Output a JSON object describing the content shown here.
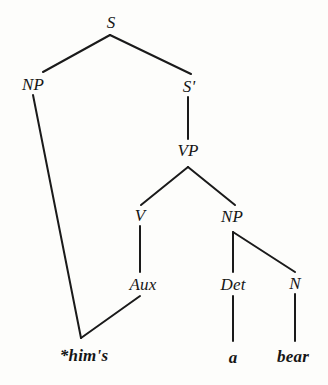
{
  "figure": {
    "kind": "syntax-tree",
    "background_color": "#fdfdfb",
    "stroke_color": "#1a1a1a"
  },
  "nodes": [
    {
      "id": "S",
      "label": "S",
      "x": 111,
      "y": 22,
      "type": "nonterminal"
    },
    {
      "id": "NP1",
      "label": "NP",
      "x": 33,
      "y": 84,
      "type": "nonterminal"
    },
    {
      "id": "SBAR",
      "label": "S'",
      "x": 189,
      "y": 86,
      "type": "nonterminal"
    },
    {
      "id": "VP",
      "label": "VP",
      "x": 188,
      "y": 150,
      "type": "nonterminal"
    },
    {
      "id": "V",
      "label": "V",
      "x": 140,
      "y": 215,
      "type": "nonterminal"
    },
    {
      "id": "NP2",
      "label": "NP",
      "x": 232,
      "y": 216,
      "type": "nonterminal"
    },
    {
      "id": "AUX",
      "label": "Aux",
      "x": 143,
      "y": 284,
      "type": "nonterminal"
    },
    {
      "id": "DET",
      "label": "Det",
      "x": 233,
      "y": 284,
      "type": "nonterminal"
    },
    {
      "id": "N",
      "label": "N",
      "x": 295,
      "y": 283,
      "type": "nonterminal"
    },
    {
      "id": "W1",
      "label": "*him's",
      "x": 84,
      "y": 355,
      "type": "terminal"
    },
    {
      "id": "W2",
      "label": "a",
      "x": 233,
      "y": 357,
      "type": "terminal"
    },
    {
      "id": "W3",
      "label": "bear",
      "x": 293,
      "y": 356,
      "type": "terminal"
    }
  ],
  "edges": [
    {
      "from": "S",
      "to": "NP1",
      "x1": 110,
      "y1": 35,
      "x2": 43,
      "y2": 72
    },
    {
      "from": "S",
      "to": "SBAR",
      "x1": 110,
      "y1": 35,
      "x2": 191,
      "y2": 74
    },
    {
      "from": "SBAR",
      "to": "VP",
      "x1": 188,
      "y1": 97,
      "x2": 188,
      "y2": 139
    },
    {
      "from": "VP",
      "to": "V",
      "x1": 188,
      "y1": 167,
      "x2": 141,
      "y2": 205
    },
    {
      "from": "VP",
      "to": "NP2",
      "x1": 188,
      "y1": 167,
      "x2": 235,
      "y2": 205
    },
    {
      "from": "V",
      "to": "AUX",
      "x1": 140,
      "y1": 226,
      "x2": 140,
      "y2": 272
    },
    {
      "from": "NP2",
      "to": "DET",
      "x1": 233,
      "y1": 232,
      "x2": 233,
      "y2": 272
    },
    {
      "from": "NP2",
      "to": "N",
      "x1": 233,
      "y1": 232,
      "x2": 295,
      "y2": 272
    },
    {
      "from": "NP1",
      "to": "W1",
      "x1": 33,
      "y1": 95,
      "x2": 81,
      "y2": 338
    },
    {
      "from": "AUX",
      "to": "W1",
      "x1": 140,
      "y1": 296,
      "x2": 81,
      "y2": 338
    },
    {
      "from": "DET",
      "to": "W2",
      "x1": 233,
      "y1": 296,
      "x2": 233,
      "y2": 341
    },
    {
      "from": "N",
      "to": "W3",
      "x1": 295,
      "y1": 294,
      "x2": 295,
      "y2": 341
    }
  ]
}
